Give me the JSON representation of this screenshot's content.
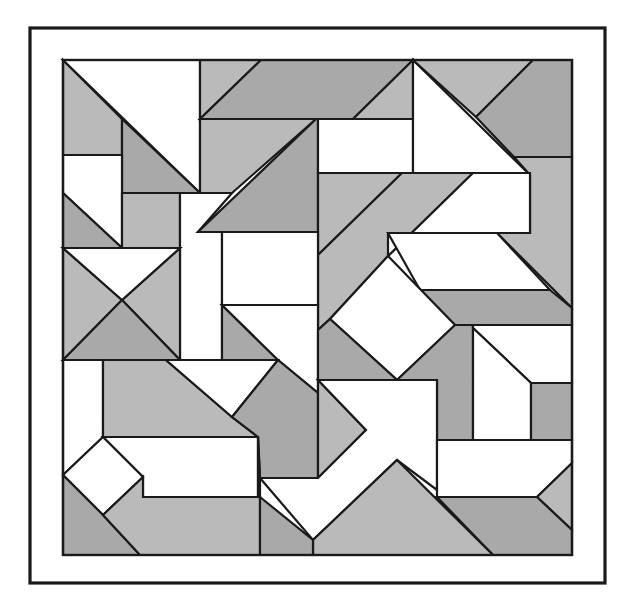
{
  "colors": {
    "white": "#ffffff",
    "light": "#c9c9c9",
    "mid": "#bababa",
    "dark": "#a9a9a9",
    "stroke": "#1a1a1a"
  },
  "frame": {
    "x": 30,
    "y": 28,
    "w": 575,
    "h": 555
  },
  "inner": {
    "x": 63,
    "y": 60,
    "w": 509,
    "h": 495
  },
  "pieces": [
    {
      "id": "p1",
      "fill": "mid",
      "pts": "63,60 63,155 122,155 122,119"
    },
    {
      "id": "p2",
      "fill": "white",
      "pts": "63,60 200,60 200,193"
    },
    {
      "id": "p3",
      "fill": "dark",
      "pts": "122,119 200,193 122,193"
    },
    {
      "id": "p4",
      "fill": "white",
      "pts": "63,155 122,155 122,248 63,193"
    },
    {
      "id": "p5",
      "fill": "dark",
      "pts": "63,193 122,248 63,248"
    },
    {
      "id": "p6",
      "fill": "mid",
      "pts": "122,193 180,193 180,248 122,248"
    },
    {
      "id": "p7",
      "fill": "white",
      "pts": "180,193 232,193 198,232 222,232 222,360 180,360"
    },
    {
      "id": "p8",
      "fill": "mid",
      "pts": "200,60 261,60 200,119"
    },
    {
      "id": "p9",
      "fill": "dark",
      "pts": "261,60 413,60 353,119 200,119"
    },
    {
      "id": "p10",
      "fill": "mid",
      "pts": "353,119 413,60 413,119"
    },
    {
      "id": "p11",
      "fill": "mid",
      "pts": "200,119 316,119 232,193 200,193"
    },
    {
      "id": "p12",
      "fill": "dark",
      "pts": "316,119 318,119 318,232 198,232"
    },
    {
      "id": "p13",
      "fill": "white",
      "pts": "318,119 413,119 413,173 318,173"
    },
    {
      "id": "p14",
      "fill": "white",
      "pts": "413,60 530,175 413,175"
    },
    {
      "id": "p15",
      "fill": "mid",
      "pts": "413,60 533,60 476,117"
    },
    {
      "id": "p16",
      "fill": "dark",
      "pts": "533,60 572,60 572,157 514,157 476,117"
    },
    {
      "id": "p17",
      "fill": "mid",
      "pts": "514,157 572,157 572,308 497,233 530,233 530,175"
    },
    {
      "id": "p18",
      "fill": "mid",
      "pts": "318,173 402,173 318,255"
    },
    {
      "id": "p19",
      "fill": "mid",
      "pts": "402,173 473,173 388,256 330,319 318,330 318,255"
    },
    {
      "id": "p20",
      "fill": "white",
      "pts": "473,173 530,173 530,233 388,233 388,256"
    },
    {
      "id": "p21",
      "fill": "white",
      "pts": "222,232 318,232 318,305 222,305"
    },
    {
      "id": "p22",
      "fill": "white",
      "pts": "388,233 497,233 550,290 420,290"
    },
    {
      "id": "p23",
      "fill": "dark",
      "pts": "420,290 550,290 572,308 572,325 455,325"
    },
    {
      "id": "p24",
      "fill": "white",
      "pts": "388,256 455,325 397,380 330,319"
    },
    {
      "id": "p25",
      "fill": "mid",
      "pts": "63,248 122,300 63,360"
    },
    {
      "id": "p26",
      "fill": "mid",
      "pts": "180,248 122,300 180,360"
    },
    {
      "id": "p27",
      "fill": "white",
      "pts": "63,248 180,248 122,300"
    },
    {
      "id": "p28",
      "fill": "dark",
      "pts": "63,360 122,300 180,360"
    },
    {
      "id": "p29",
      "fill": "dark",
      "pts": "222,305 278,360 222,360"
    },
    {
      "id": "p30",
      "fill": "white",
      "pts": "222,305 318,305 318,393 278,360"
    },
    {
      "id": "p31",
      "fill": "dark",
      "pts": "318,330 330,319 397,380 318,380"
    },
    {
      "id": "p32",
      "fill": "dark",
      "pts": "455,325 473,325 473,440 437,440 437,383 397,380"
    },
    {
      "id": "p33",
      "fill": "white",
      "pts": "473,325 572,325 572,383 531,383 473,328"
    },
    {
      "id": "p34",
      "fill": "white",
      "pts": "473,328 531,383 531,440 473,440"
    },
    {
      "id": "p35",
      "fill": "dark",
      "pts": "531,383 572,383 572,440 531,440"
    },
    {
      "id": "p36",
      "fill": "white",
      "pts": "63,360 103,360 103,437 63,475"
    },
    {
      "id": "p37",
      "fill": "mid",
      "pts": "103,360 166,360 232,417 258,437 103,437"
    },
    {
      "id": "p38",
      "fill": "white",
      "pts": "166,360 278,360 232,417"
    },
    {
      "id": "p39",
      "fill": "dark",
      "pts": "278,360 318,393 318,478 260,478 258,437 232,417"
    },
    {
      "id": "p40",
      "fill": "mid",
      "pts": "318,380 366,430 318,478"
    },
    {
      "id": "p41",
      "fill": "white",
      "pts": "318,380 437,380 437,490 397,460 313,540 260,478 318,478 366,430"
    },
    {
      "id": "p42",
      "fill": "white",
      "pts": "437,440 572,440 572,463 537,497 437,497"
    },
    {
      "id": "p43",
      "fill": "mid",
      "pts": "572,463 572,530 537,497"
    },
    {
      "id": "p44",
      "fill": "dark",
      "pts": "437,497 537,497 572,530 572,555 493,555 437,497"
    },
    {
      "id": "p45",
      "fill": "mid",
      "pts": "397,460 493,555 313,555 313,540"
    },
    {
      "id": "p46",
      "fill": "white",
      "pts": "103,437 258,437 258,497 143,497 143,477 103,437"
    },
    {
      "id": "p47",
      "fill": "white",
      "pts": "63,475 103,437 143,477 103,515"
    },
    {
      "id": "p48",
      "fill": "dark",
      "pts": "63,475 103,515 140,555 63,555"
    },
    {
      "id": "p49",
      "fill": "mid",
      "pts": "103,515 143,477 143,497 260,497 260,555 140,555"
    },
    {
      "id": "p50",
      "fill": "dark",
      "pts": "260,497 313,540 313,555 260,555"
    },
    {
      "id": "p51",
      "fill": "white",
      "pts": "258,437 260,478 260,497 258,497"
    }
  ]
}
